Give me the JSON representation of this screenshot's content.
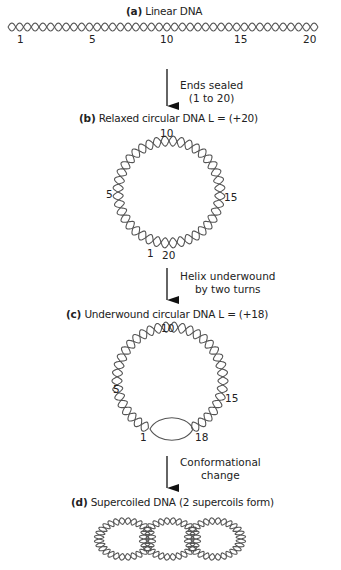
{
  "panels": {
    "a": {
      "letter": "(a)",
      "title": "Linear DNA",
      "labels": [
        "1",
        "5",
        "10",
        "15",
        "20"
      ]
    },
    "b": {
      "letter": "(b)",
      "title": "Relaxed circular DNA L = (+20)",
      "labels": {
        "top": "10",
        "left": "5",
        "right": "15",
        "bottom_left": "1",
        "bottom_right": "20"
      }
    },
    "c": {
      "letter": "(c)",
      "title": "Underwound circular DNA L = (+18)",
      "labels": {
        "top": "10",
        "left": "5",
        "right": "15",
        "bottom_left": "1",
        "bottom_right": "18"
      }
    },
    "d": {
      "letter": "(d)",
      "title": "Supercoiled DNA (2 supercoils form)"
    }
  },
  "steps": [
    {
      "line1": "Ends sealed",
      "line2": "(1 to 20)"
    },
    {
      "line1": "Helix underwound",
      "line2": "by two turns"
    },
    {
      "line1": "Conformational",
      "line2": "change"
    }
  ],
  "colors": {
    "strand": "#555555",
    "text": "#222222",
    "arrow": "#111111"
  }
}
